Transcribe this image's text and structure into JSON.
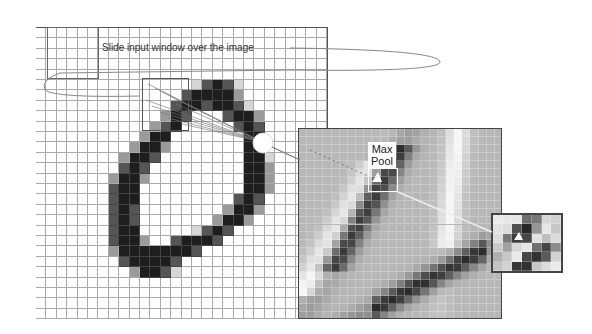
{
  "diagram": {
    "title_annotation": "Slide input window over the image",
    "maxpool_label_line1": "Max",
    "maxpool_label_line2": "Pool",
    "input_grid": {
      "rows": 28,
      "cols": 28,
      "cell": 10.4,
      "x": 36,
      "y": 27
    },
    "feature_map": {
      "rows": 24,
      "cols": 25,
      "x": 298,
      "y": 128,
      "w": 204,
      "h": 191
    },
    "pooled_patch": {
      "rows": 6,
      "cols": 7,
      "x": 491,
      "y": 213,
      "w": 72,
      "h": 60
    },
    "colors": {
      "grid_line": "#aaaaaa",
      "dark": "#222222",
      "fmap_bg": "#b7b7b7",
      "arrow": "#888888"
    },
    "digit_strokes": [
      [
        5,
        16,
        3
      ],
      [
        5,
        17,
        4
      ],
      [
        5,
        18,
        3
      ],
      [
        5,
        19,
        1
      ],
      [
        5,
        15,
        1
      ],
      [
        6,
        14,
        3
      ],
      [
        6,
        15,
        4
      ],
      [
        6,
        16,
        4
      ],
      [
        6,
        17,
        4
      ],
      [
        6,
        18,
        4
      ],
      [
        6,
        19,
        2
      ],
      [
        7,
        13,
        3
      ],
      [
        7,
        14,
        4
      ],
      [
        7,
        15,
        4
      ],
      [
        7,
        16,
        3
      ],
      [
        7,
        17,
        4
      ],
      [
        7,
        18,
        4
      ],
      [
        7,
        19,
        3
      ],
      [
        7,
        20,
        1
      ],
      [
        8,
        12,
        2
      ],
      [
        8,
        13,
        4
      ],
      [
        8,
        14,
        3
      ],
      [
        8,
        18,
        3
      ],
      [
        8,
        19,
        4
      ],
      [
        8,
        20,
        4
      ],
      [
        8,
        21,
        2
      ],
      [
        9,
        11,
        2
      ],
      [
        9,
        12,
        3
      ],
      [
        9,
        13,
        4
      ],
      [
        9,
        19,
        3
      ],
      [
        9,
        20,
        4
      ],
      [
        9,
        21,
        3
      ],
      [
        10,
        10,
        2
      ],
      [
        10,
        11,
        4
      ],
      [
        10,
        12,
        4
      ],
      [
        10,
        20,
        4
      ],
      [
        10,
        21,
        4
      ],
      [
        11,
        9,
        2
      ],
      [
        11,
        10,
        4
      ],
      [
        11,
        11,
        4
      ],
      [
        11,
        12,
        2
      ],
      [
        11,
        20,
        4
      ],
      [
        11,
        21,
        4
      ],
      [
        12,
        8,
        2
      ],
      [
        12,
        9,
        4
      ],
      [
        12,
        10,
        4
      ],
      [
        12,
        11,
        3
      ],
      [
        12,
        20,
        4
      ],
      [
        12,
        21,
        4
      ],
      [
        12,
        22,
        1
      ],
      [
        13,
        8,
        3
      ],
      [
        13,
        9,
        4
      ],
      [
        13,
        10,
        3
      ],
      [
        13,
        20,
        4
      ],
      [
        13,
        21,
        4
      ],
      [
        13,
        22,
        2
      ],
      [
        14,
        7,
        2
      ],
      [
        14,
        8,
        4
      ],
      [
        14,
        9,
        4
      ],
      [
        14,
        10,
        2
      ],
      [
        14,
        20,
        4
      ],
      [
        14,
        21,
        4
      ],
      [
        14,
        22,
        2
      ],
      [
        15,
        7,
        3
      ],
      [
        15,
        8,
        4
      ],
      [
        15,
        9,
        4
      ],
      [
        15,
        20,
        4
      ],
      [
        15,
        21,
        4
      ],
      [
        15,
        22,
        2
      ],
      [
        16,
        7,
        3
      ],
      [
        16,
        8,
        4
      ],
      [
        16,
        9,
        4
      ],
      [
        16,
        19,
        3
      ],
      [
        16,
        20,
        4
      ],
      [
        16,
        21,
        3
      ],
      [
        17,
        7,
        3
      ],
      [
        17,
        8,
        4
      ],
      [
        17,
        9,
        3
      ],
      [
        17,
        18,
        2
      ],
      [
        17,
        19,
        4
      ],
      [
        17,
        20,
        4
      ],
      [
        17,
        21,
        2
      ],
      [
        18,
        7,
        3
      ],
      [
        18,
        8,
        4
      ],
      [
        18,
        9,
        3
      ],
      [
        18,
        17,
        2
      ],
      [
        18,
        18,
        4
      ],
      [
        18,
        19,
        4
      ],
      [
        18,
        20,
        2
      ],
      [
        19,
        7,
        3
      ],
      [
        19,
        8,
        4
      ],
      [
        19,
        9,
        4
      ],
      [
        19,
        15,
        1
      ],
      [
        19,
        16,
        3
      ],
      [
        19,
        17,
        4
      ],
      [
        19,
        18,
        3
      ],
      [
        20,
        7,
        3
      ],
      [
        20,
        8,
        4
      ],
      [
        20,
        9,
        4
      ],
      [
        20,
        10,
        2
      ],
      [
        20,
        13,
        3
      ],
      [
        20,
        14,
        4
      ],
      [
        20,
        15,
        4
      ],
      [
        20,
        16,
        4
      ],
      [
        20,
        17,
        3
      ],
      [
        21,
        7,
        2
      ],
      [
        21,
        8,
        4
      ],
      [
        21,
        9,
        4
      ],
      [
        21,
        10,
        4
      ],
      [
        21,
        11,
        4
      ],
      [
        21,
        12,
        4
      ],
      [
        21,
        13,
        4
      ],
      [
        21,
        14,
        4
      ],
      [
        21,
        15,
        3
      ],
      [
        22,
        8,
        3
      ],
      [
        22,
        9,
        4
      ],
      [
        22,
        10,
        4
      ],
      [
        22,
        11,
        4
      ],
      [
        22,
        12,
        4
      ],
      [
        22,
        13,
        3
      ],
      [
        23,
        9,
        2
      ],
      [
        23,
        10,
        4
      ],
      [
        23,
        11,
        4
      ],
      [
        23,
        12,
        3
      ],
      [
        23,
        13,
        1
      ]
    ]
  }
}
